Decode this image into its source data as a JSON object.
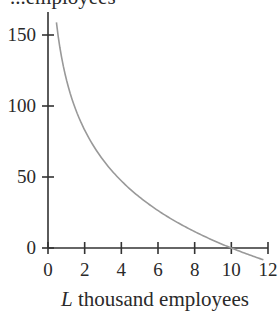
{
  "chart_data": {
    "type": "line",
    "title": "",
    "top_label_partial": "...employees",
    "xlabel_var": "L",
    "xlabel_text": " thousand employees",
    "ylabel": "",
    "xlim": [
      0,
      12
    ],
    "ylim": [
      0,
      150
    ],
    "x_ticks": [
      0,
      2,
      4,
      6,
      8,
      10,
      12
    ],
    "y_ticks": [
      0,
      50,
      100,
      150
    ],
    "grid": false,
    "legend": null,
    "series": [
      {
        "name": "curve",
        "color": "#999999",
        "x": [
          0.5,
          1,
          1.5,
          2,
          3,
          4,
          5,
          6,
          7,
          8,
          9,
          10,
          11,
          11.7
        ],
        "y": [
          155,
          119,
          98,
          83,
          62,
          47,
          36,
          26,
          18,
          11.5,
          5.4,
          0,
          -4.9,
          -8
        ]
      }
    ]
  },
  "colors": {
    "axis": "#333333",
    "curve": "#999999",
    "text": "#2a2a2a"
  }
}
